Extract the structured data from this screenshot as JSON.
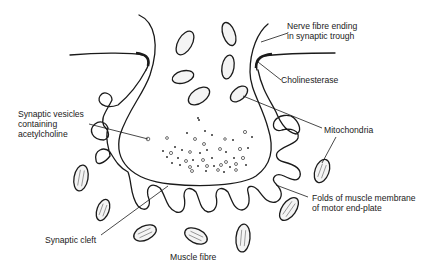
{
  "figure": {
    "background": "#ffffff",
    "ink_color": "#1a1a1a"
  },
  "labels": {
    "nerve_fibre": [
      "Nerve fibre ending",
      "in synaptic trough"
    ],
    "cholinesterase": "Cholinesterase",
    "vesicles": [
      "Synaptic vesicles",
      "containing",
      "acetylcholine"
    ],
    "mitochondria": "Mitochondria",
    "folds": [
      "Folds of muscle membrane",
      "of motor end-plate"
    ],
    "synaptic_cleft": "Synaptic cleft",
    "muscle_fibre": "Muscle fibre"
  }
}
